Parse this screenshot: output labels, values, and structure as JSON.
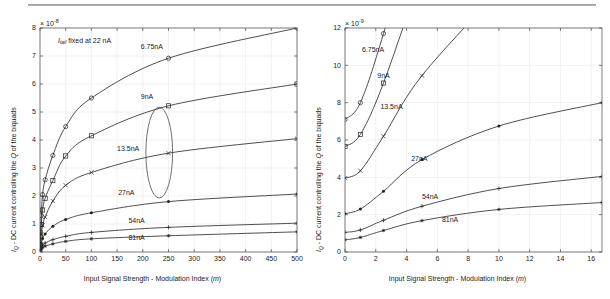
{
  "figure": {
    "background": "#ffffff",
    "ink_color": "#222222",
    "grid_color": "#e2e2e2",
    "top_rule": true
  },
  "chart_data": [
    {
      "type": "line",
      "panel": "left",
      "title": "",
      "xlabel": "Input Signal Strength - Modulation Index (m)",
      "ylabel": "I_Q - DC current controlling the Q of the biquads",
      "ylabel_parts": {
        "sub": "Q",
        "lead": "I",
        "rest": " - DC current controlling the Q of the biquads"
      },
      "exponent_label": "×10⁻⁸",
      "exponent_mantissa": "× 10",
      "exponent_power": "-8",
      "annotation": "I_tail fixed at 22 nA",
      "annotation_lead": "I",
      "annotation_sub": "tail",
      "annotation_rest": " fixed at 22 nA",
      "xlim": [
        0,
        500
      ],
      "ylim": [
        0,
        8
      ],
      "xticks": [
        0,
        50,
        100,
        150,
        200,
        250,
        300,
        350,
        400,
        450,
        500
      ],
      "yticks": [
        0,
        1,
        2,
        3,
        4,
        5,
        6,
        7,
        8
      ],
      "grid": true,
      "legend": "inline-curve-labels",
      "ellipse_annotation": {
        "cx": 232,
        "cy": 3.55,
        "rx": 26,
        "ry": 1.62
      },
      "series": [
        {
          "name": "6.75nA",
          "marker": "circle",
          "label_x": 196,
          "label_y": 7.25,
          "x": [
            0,
            1,
            2.5,
            5,
            10,
            25,
            50,
            100,
            250,
            500
          ],
          "y": [
            0.3,
            0.72,
            1.3,
            2.05,
            2.58,
            3.45,
            4.48,
            5.5,
            6.92,
            8.0
          ]
        },
        {
          "name": "9nA",
          "marker": "square",
          "label_x": 196,
          "label_y": 5.45,
          "x": [
            0,
            1,
            2.5,
            5,
            10,
            25,
            50,
            100,
            250,
            500
          ],
          "y": [
            0.22,
            0.55,
            0.98,
            1.5,
            1.92,
            2.55,
            3.43,
            4.15,
            5.22,
            6.0
          ]
        },
        {
          "name": "13.5nA",
          "marker": "x",
          "label_x": 150,
          "label_y": 3.62,
          "x": [
            0,
            1,
            2.5,
            5,
            10,
            25,
            50,
            100,
            250,
            500
          ],
          "y": [
            0.14,
            0.36,
            0.62,
            0.95,
            1.25,
            1.82,
            2.38,
            2.84,
            3.53,
            4.05
          ]
        },
        {
          "name": "27nA",
          "marker": "dot",
          "label_x": 152,
          "label_y": 2.02,
          "x": [
            0,
            1,
            2.5,
            5,
            10,
            25,
            50,
            100,
            250,
            500
          ],
          "y": [
            0.07,
            0.18,
            0.31,
            0.48,
            0.64,
            0.92,
            1.16,
            1.4,
            1.8,
            2.07
          ]
        },
        {
          "name": "54nA",
          "marker": "plus",
          "label_x": 172,
          "label_y": 1.05,
          "x": [
            0,
            1,
            2.5,
            5,
            10,
            25,
            50,
            100,
            250,
            500
          ],
          "y": [
            0.035,
            0.09,
            0.16,
            0.24,
            0.32,
            0.44,
            0.56,
            0.7,
            0.88,
            1.03
          ]
        },
        {
          "name": "81nA",
          "marker": "star",
          "label_x": 172,
          "label_y": 0.42,
          "x": [
            0,
            1,
            2.5,
            5,
            10,
            25,
            50,
            100,
            250,
            500
          ],
          "y": [
            0.022,
            0.06,
            0.1,
            0.16,
            0.21,
            0.29,
            0.38,
            0.47,
            0.58,
            0.72
          ]
        }
      ]
    },
    {
      "type": "line",
      "panel": "right",
      "title": "",
      "xlabel": "Input Signal Strength - Modulation Index (m)",
      "ylabel": "I_Q - DC current controlling the Q of the biquads",
      "ylabel_parts": {
        "sub": "Q",
        "lead": "I",
        "rest": " - DC current controlling the Q of the biquads"
      },
      "exponent_label": "×10⁻⁹",
      "exponent_mantissa": "× 10",
      "exponent_power": "-9",
      "xlim": [
        0,
        16.7
      ],
      "ylim": [
        0,
        12
      ],
      "xticks": [
        0,
        2,
        4,
        6,
        8,
        10,
        12,
        14,
        16
      ],
      "yticks": [
        0,
        2,
        4,
        6,
        8,
        10,
        12
      ],
      "grid": true,
      "legend": "inline-curve-labels",
      "series": [
        {
          "name": "6.75nA",
          "marker": "circle",
          "label_x": 1.1,
          "label_y": 10.7,
          "x": [
            0,
            1,
            2.5,
            5
          ],
          "y": [
            7.1,
            8.0,
            11.7,
            19.0
          ]
        },
        {
          "name": "9nA",
          "marker": "square",
          "label_x": 2.1,
          "label_y": 9.3,
          "x": [
            0,
            1,
            2.5,
            5
          ],
          "y": [
            5.65,
            6.3,
            9.05,
            15.0
          ]
        },
        {
          "name": "13.5nA",
          "marker": "x",
          "label_x": 2.3,
          "label_y": 7.65,
          "x": [
            0,
            1,
            2.5,
            5,
            10
          ],
          "y": [
            3.95,
            4.35,
            6.2,
            9.45,
            14.0
          ]
        },
        {
          "name": "27nA",
          "marker": "dot",
          "label_x": 4.3,
          "label_y": 4.85,
          "x": [
            0,
            1,
            2.5,
            5,
            10,
            16.7
          ],
          "y": [
            2.05,
            2.3,
            3.25,
            4.95,
            6.75,
            8.0
          ]
        },
        {
          "name": "54nA",
          "marker": "plus",
          "label_x": 5.0,
          "label_y": 2.85,
          "x": [
            0,
            1,
            2.5,
            5,
            10,
            16.7
          ],
          "y": [
            1.05,
            1.18,
            1.7,
            2.45,
            3.4,
            4.05
          ]
        },
        {
          "name": "81nA",
          "marker": "star",
          "label_x": 6.3,
          "label_y": 1.6,
          "x": [
            0,
            1,
            2.5,
            5,
            10,
            16.7
          ],
          "y": [
            0.65,
            0.78,
            1.15,
            1.68,
            2.28,
            2.65
          ]
        }
      ]
    }
  ]
}
